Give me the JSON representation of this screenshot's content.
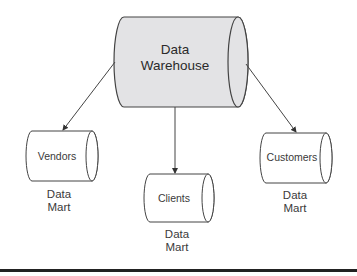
{
  "diagram": {
    "central": {
      "label_line1": "Data",
      "label_line2": "Warehouse",
      "fill": "#e3e3e5",
      "stroke": "#444444"
    },
    "nodes": [
      {
        "name": "Vendors",
        "caption_line1": "Data",
        "caption_line2": "Mart"
      },
      {
        "name": "Clients",
        "caption_line1": "Data",
        "caption_line2": "Mart"
      },
      {
        "name": "Customers",
        "caption_line1": "Data",
        "caption_line2": "Mart"
      }
    ],
    "edges": [
      {
        "from": "Data Warehouse",
        "to": "Vendors"
      },
      {
        "from": "Data Warehouse",
        "to": "Clients"
      },
      {
        "from": "Data Warehouse",
        "to": "Customers"
      }
    ]
  }
}
